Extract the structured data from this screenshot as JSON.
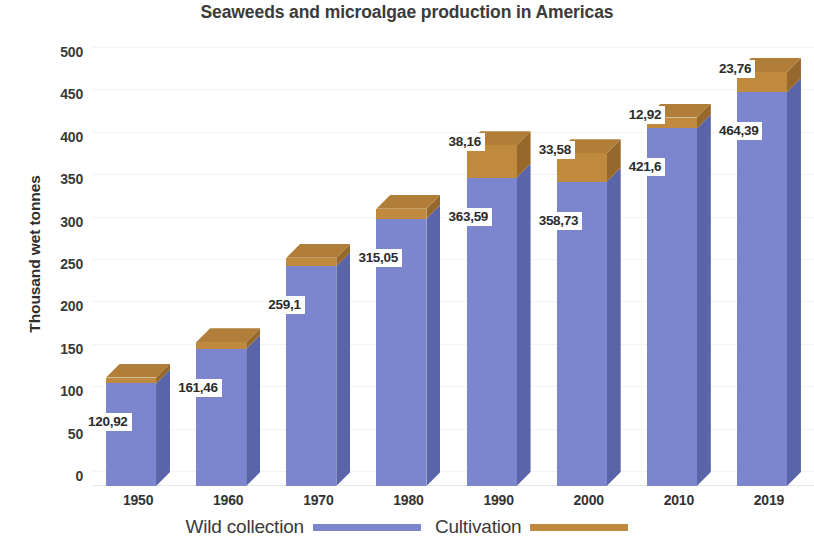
{
  "chart_data": {
    "type": "bar",
    "subtype": "stacked-3d-column",
    "title": "Seaweeds and microalgae production in Americas",
    "xlabel": "",
    "ylabel": "Thousand wet tonnes",
    "ylim": [
      0,
      500
    ],
    "ytick_step": 50,
    "yticks": [
      "500",
      "450",
      "400",
      "350",
      "300",
      "250",
      "200",
      "150",
      "100",
      "50",
      "0"
    ],
    "ytick_values": [
      500,
      450,
      400,
      350,
      300,
      250,
      200,
      150,
      100,
      50,
      0
    ],
    "categories": [
      "1950",
      "1960",
      "1970",
      "1980",
      "1990",
      "2000",
      "2010",
      "2019"
    ],
    "grid": true,
    "legend_position": "bottom",
    "series": [
      {
        "name": "Wild collection",
        "color": "#7C86CE",
        "values": [
          120.92,
          161.46,
          259.1,
          315.05,
          363.59,
          358.73,
          421.6,
          464.39
        ],
        "labels": [
          "120,92",
          "161,46",
          "259,1",
          "315,05",
          "363,59",
          "358,73",
          "421,6",
          "464,39"
        ]
      },
      {
        "name": "Cultivation",
        "color": "#C08A3E",
        "values": [
          7.0,
          8.0,
          10.0,
          12.0,
          38.16,
          33.58,
          12.92,
          23.76
        ],
        "labels": [
          "",
          "",
          "",
          "",
          "38,16",
          "33,58",
          "12,92",
          "23,76"
        ]
      }
    ]
  },
  "legend": {
    "items": [
      {
        "label": "Wild collection",
        "color": "#7C86CE",
        "swatch": "line-swatch-blue"
      },
      {
        "label": "Cultivation",
        "color": "#C08A3E",
        "swatch": "line-swatch-orange"
      }
    ]
  }
}
